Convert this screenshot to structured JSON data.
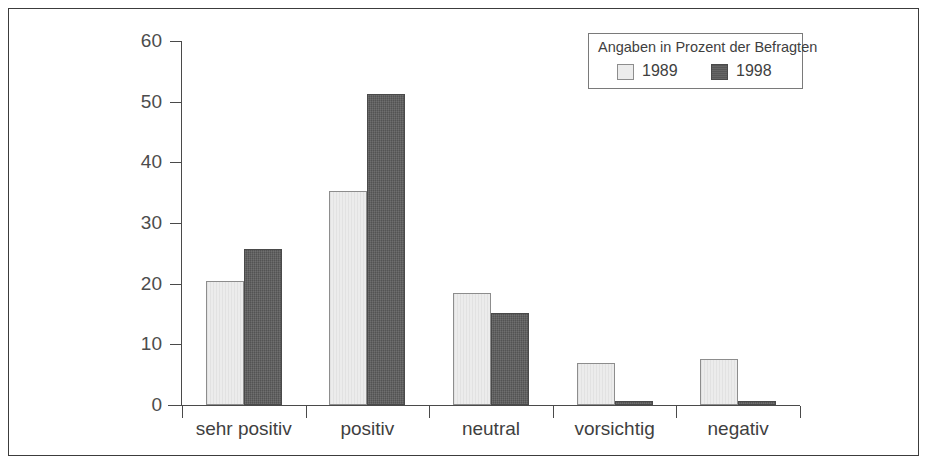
{
  "chart_data": {
    "type": "bar",
    "title": "",
    "subtitle": "",
    "xlabel": "",
    "ylabel": "",
    "categories": [
      "sehr positiv",
      "positiv",
      "neutral",
      "vorsichtig",
      "negativ"
    ],
    "series": [
      {
        "name": "1989",
        "color": "#ececec",
        "values": [
          20.4,
          35.2,
          18.4,
          7.0,
          7.6
        ]
      },
      {
        "name": "1998",
        "color": "#5c5c5c",
        "values": [
          25.7,
          51.3,
          15.2,
          0.5,
          0.5
        ]
      }
    ],
    "ylim": [
      0,
      60
    ],
    "yticks": [
      0,
      10,
      20,
      30,
      40,
      50,
      60
    ],
    "ytick_labels": [
      "0",
      "10",
      "20",
      "30",
      "40",
      "50",
      "60"
    ],
    "grid": false,
    "legend_position": "top-right",
    "legend_title": "Angaben in Prozent der Befragten",
    "annotations": []
  },
  "legend": {
    "title": "Angaben in Prozent der Befragten",
    "entries": [
      {
        "label": "1989",
        "swatch": "light-swatch"
      },
      {
        "label": "1998",
        "swatch": "dark-swatch"
      }
    ]
  },
  "axis": {
    "y_labels": [
      "60",
      "50",
      "40",
      "30",
      "20",
      "10",
      "0"
    ],
    "x_labels": [
      "sehr positiv",
      "positiv",
      "neutral",
      "vorsichtig",
      "negativ"
    ]
  }
}
